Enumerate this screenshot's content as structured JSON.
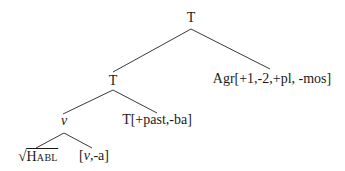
{
  "tree": {
    "root": {
      "label": "T"
    },
    "left_T": {
      "label": "T"
    },
    "agr": {
      "label": "Agr[+1,-2,+pl, -mos]"
    },
    "v": {
      "label": "v"
    },
    "t_past": {
      "label": "T[+past,-ba]"
    },
    "root_habl": {
      "radical": "√",
      "label": "Habl"
    },
    "v_a": {
      "open": "[",
      "v": "v",
      "rest": ",-a]"
    }
  },
  "edges": [
    {
      "from": "root",
      "to": "left_T"
    },
    {
      "from": "root",
      "to": "agr"
    },
    {
      "from": "left_T",
      "to": "v"
    },
    {
      "from": "left_T",
      "to": "t_past"
    },
    {
      "from": "v",
      "to": "root_habl"
    },
    {
      "from": "v",
      "to": "v_a"
    }
  ]
}
